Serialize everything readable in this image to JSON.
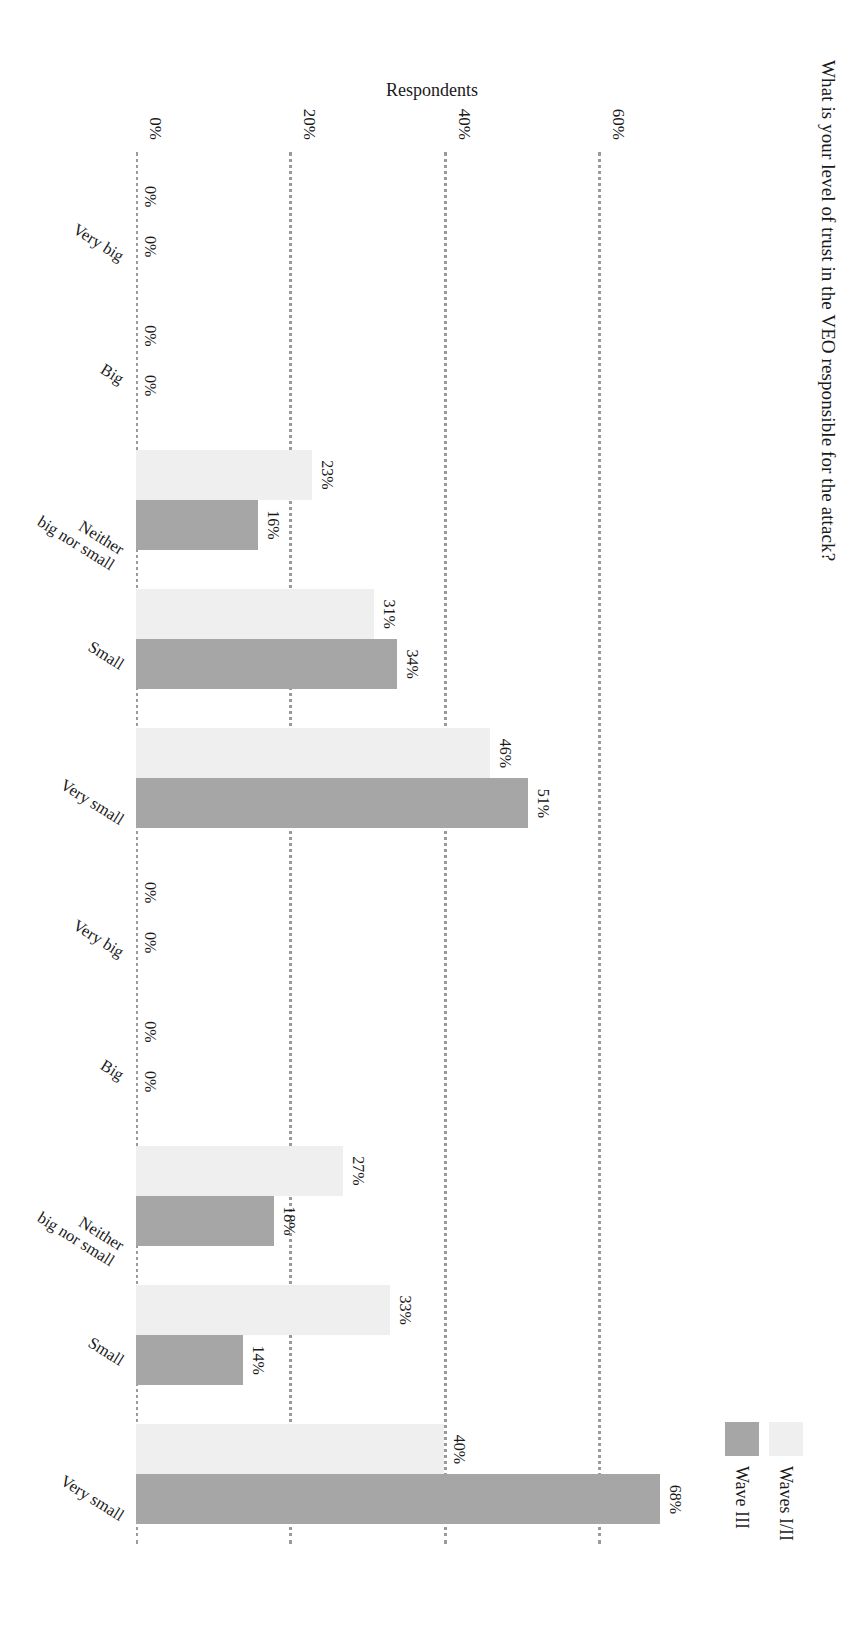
{
  "chart": {
    "title": "What is your level of trust in the VEO responsible for the attack?",
    "group_axis_title": "Age group",
    "y_axis_title": "Respondents",
    "legend": [
      {
        "label": "Waves I/II",
        "color": "#efefef"
      },
      {
        "label": "Wave III",
        "color": "#a6a6a6"
      }
    ],
    "y_ticks": [
      "60%",
      "40%",
      "20%",
      "0%"
    ]
  },
  "chart_data": {
    "type": "bar",
    "title": "What is your level of trust in the VEO responsible for the attack?",
    "xlabel": "Age group",
    "ylabel": "Respondents",
    "ylim": [
      0,
      70
    ],
    "yticks": [
      0,
      20,
      40,
      60
    ],
    "ytick_labels": [
      "0%",
      "20%",
      "40%",
      "60%"
    ],
    "grid": true,
    "grid_style": "dotted-horizontal",
    "legend_position": "top-right",
    "orientation": "vertical-bars-page-rotated-90",
    "groups": [
      "50–59",
      "Over 60"
    ],
    "categories": [
      "Very big",
      "Big",
      "Neither big nor small",
      "Small",
      "Very small"
    ],
    "series": [
      {
        "name": "Waves I/II",
        "color": "#efefef",
        "data": {
          "50–59": [
            0,
            0,
            23,
            31,
            46
          ],
          "Over 60": [
            0,
            0,
            27,
            33,
            40
          ]
        },
        "labels": {
          "50–59": [
            "0%",
            "0%",
            "23%",
            "31%",
            "46%"
          ],
          "Over 60": [
            "0%",
            "0%",
            "27%",
            "33%",
            "40%"
          ]
        }
      },
      {
        "name": "Wave III",
        "color": "#a6a6a6",
        "data": {
          "50–59": [
            0,
            0,
            16,
            34,
            51
          ],
          "Over 60": [
            0,
            0,
            18,
            14,
            68
          ]
        },
        "labels": {
          "50–59": [
            "0%",
            "0%",
            "16%",
            "34%",
            "51%"
          ],
          "Over 60": [
            "0%",
            "0%",
            "18%",
            "14%",
            "68%"
          ]
        }
      }
    ]
  }
}
